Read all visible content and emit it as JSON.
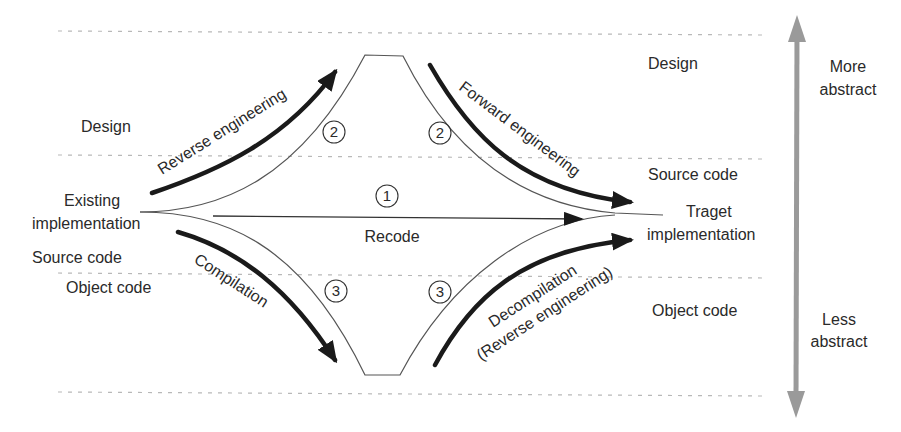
{
  "diagram": {
    "type": "reengineering-process-model",
    "levels_left": {
      "design": "Design",
      "existing_1": "Existing",
      "existing_2": "implementation",
      "source_code": "Source code",
      "object_code": "Object code"
    },
    "levels_right": {
      "design": "Design",
      "source_code": "Source code",
      "target_1": "Traget",
      "target_2": "implementation",
      "object_code": "Object code"
    },
    "paths": {
      "reverse_engineering": "Reverse engineering",
      "forward_engineering": "Forward engineering",
      "recode": "Recode",
      "compilation": "Compilation",
      "decompilation_1": "Decompilation",
      "decompilation_2": "(Reverse engineering)"
    },
    "path_numbers": {
      "recode": "1",
      "upper_left": "2",
      "upper_right": "2",
      "lower_left": "3",
      "lower_right": "3"
    },
    "abstraction_axis": {
      "top_1": "More",
      "top_2": "abstract",
      "bottom_1": "Less",
      "bottom_2": "abstract"
    },
    "colors": {
      "ink": "#2a2a2a",
      "thin_line": "#555555",
      "dotted": "#b5b5b5",
      "axis_arrow": "#9a9a9a"
    }
  }
}
